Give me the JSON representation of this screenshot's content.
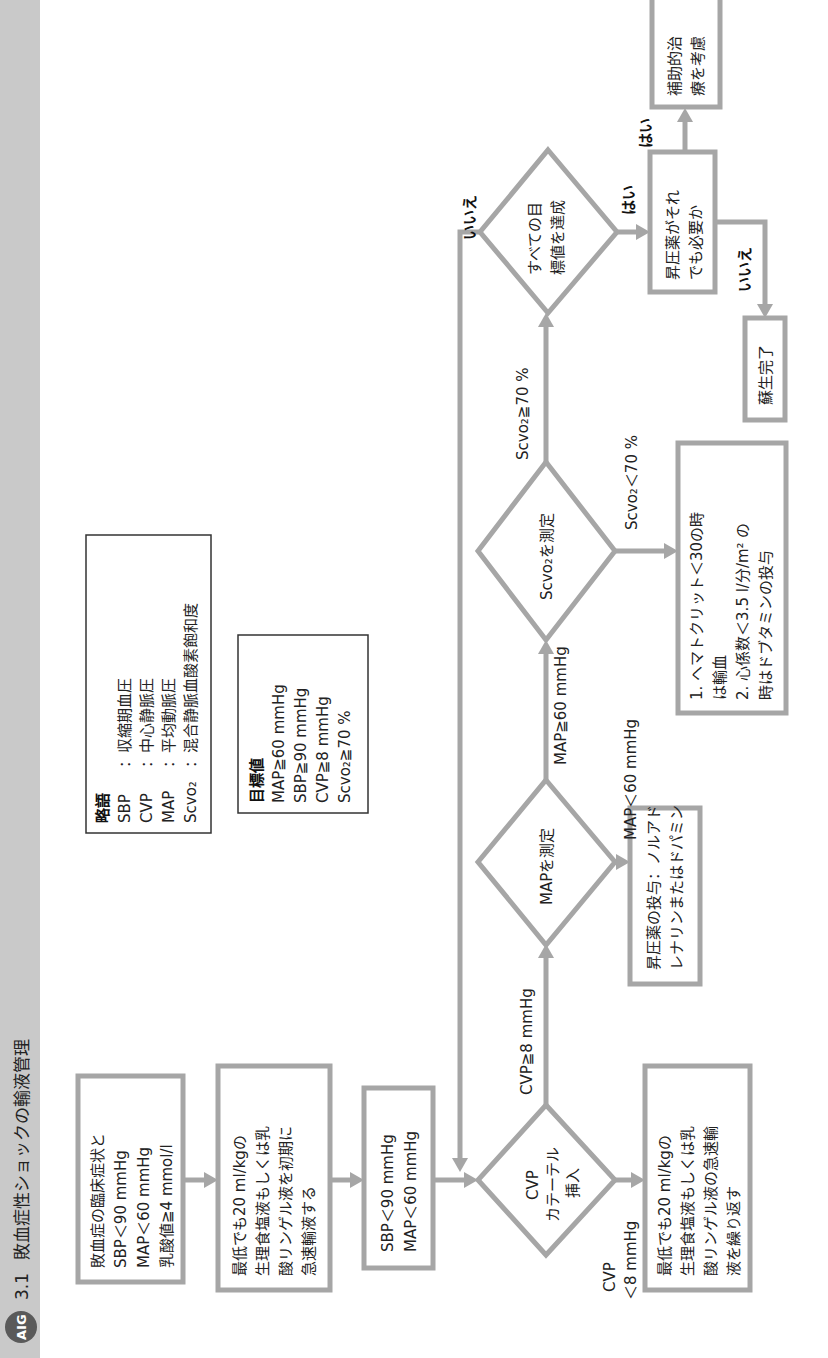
{
  "header": {
    "logo": "AIG",
    "number": "3.1",
    "title": "敗血症性ショックの輸液管理"
  },
  "colors": {
    "band": "#c9c9c9",
    "box_border": "#a6a6a6",
    "text": "#222222"
  },
  "boxes": {
    "sepsis": {
      "lines": [
        "敗血症の臨床症状と",
        "SBP＜90 mmHg",
        "MAP＜60 mmHg",
        "乳酸値≧4 mmol/l"
      ]
    },
    "initial_fluid": {
      "lines": [
        "最低でも20 ml/kgの",
        "生理食塩液もしくは乳",
        "酸リンゲル液を初期に",
        "急速輸液する"
      ]
    },
    "persistent_hypotension": {
      "lines": [
        "SBP＜90 mmHg",
        "MAP＜60 mmHg"
      ]
    },
    "repeat_fluid": {
      "lines": [
        "最低でも20 ml/kgの",
        "生理食塩液もしくは乳",
        "酸リンゲル液の急速輸",
        "液を繰り返す"
      ]
    },
    "vasopressor": {
      "lines": [
        "昇圧薬の投与：ノルアド",
        "レナリンまたはドパミン"
      ]
    },
    "transfusion": {
      "lines": [
        "1. ヘマトクリット＜30の時",
        "    は輸血",
        "2. 心係数＜3.5 l/分/m² の",
        "    時はドブタミンの投与"
      ]
    },
    "still_vasopressor": {
      "lines": [
        "昇圧薬がそれ",
        "でも必要か"
      ]
    },
    "adjunct": {
      "lines": [
        "補助的治",
        "療を考慮"
      ]
    },
    "complete": {
      "lines": [
        "蘇生完了"
      ]
    }
  },
  "diamonds": {
    "cvp": {
      "lines": [
        "CVP",
        "カテーテル",
        "挿入"
      ]
    },
    "map": {
      "lines": [
        "MAPを測定"
      ]
    },
    "scvo2": {
      "lines": [
        "Scvo₂を測定"
      ]
    },
    "goals": {
      "lines": [
        "すべての目",
        "標値を達成"
      ]
    }
  },
  "edge_labels": {
    "cvp_high": "CVP≧8 mmHg",
    "cvp_low_1": "CVP",
    "cvp_low_2": "＜8 mmHg",
    "map_high": "MAP≧60 mmHg",
    "map_low": "MAP＜60 mmHg",
    "scvo2_high": "Scvo₂≧70 %",
    "scvo2_low": "Scvo₂＜70 %",
    "goals_no": "いいえ",
    "goals_yes": "はい",
    "still_yes": "はい",
    "still_no": "いいえ"
  },
  "abbreviations": {
    "title": "略語",
    "items": [
      {
        "abbr": "SBP",
        "desc": "：収縮期血圧"
      },
      {
        "abbr": "CVP",
        "desc": "：中心静脈圧"
      },
      {
        "abbr": "MAP",
        "desc": "：平均動脈圧"
      },
      {
        "abbr": "Scvo₂",
        "desc": "：混合静脈血酸素飽和度"
      }
    ]
  },
  "targets": {
    "title": "目標値",
    "items": [
      "MAP≧60 mmHg",
      "SBP≧90 mmHg",
      "CVP≧8 mmHg",
      "Scvo₂≧70 %"
    ]
  }
}
